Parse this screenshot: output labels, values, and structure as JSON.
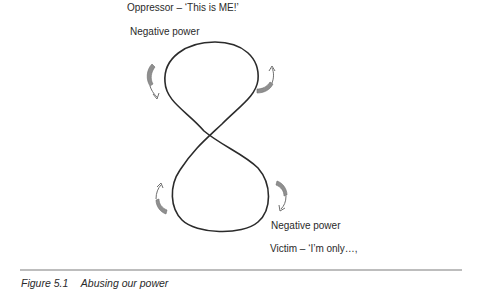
{
  "diagram": {
    "top_title": "Oppressor  – ‘This is ME!’",
    "top_label": "Negative power",
    "bottom_label": "Negative power",
    "bottom_title": "Victim – ‘I’m only…,",
    "shape": "figure-eight",
    "stroke_color": "#2b2b2b",
    "arrow_fill": "#8f8f8f",
    "arrows": [
      {
        "position": "upper-left",
        "direction": "downward"
      },
      {
        "position": "upper-right",
        "direction": "upward"
      },
      {
        "position": "lower-left",
        "direction": "upward"
      },
      {
        "position": "lower-right",
        "direction": "downward"
      }
    ]
  },
  "caption": {
    "figure_number": "Figure 5.1",
    "title": "Abusing our power"
  }
}
